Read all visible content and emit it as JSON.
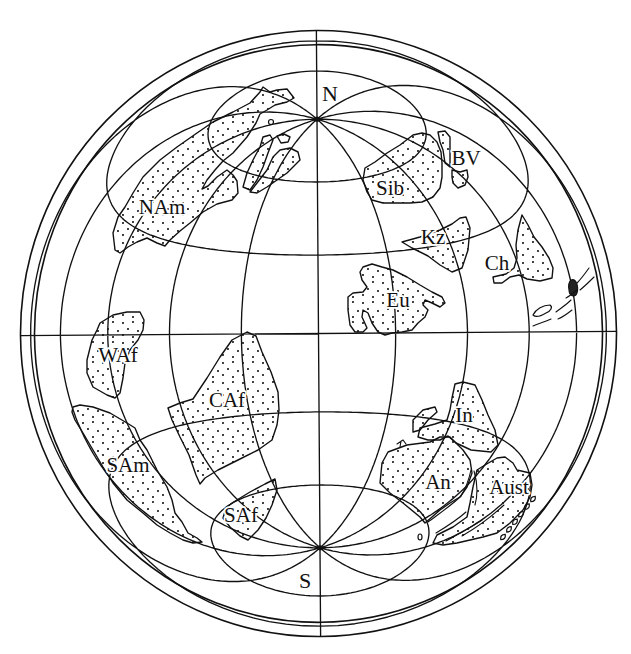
{
  "colors": {
    "ink": "#111111",
    "paper": "#ffffff"
  },
  "figure": {
    "pole_labels": {
      "north": "N",
      "south": "S"
    },
    "graticule": {
      "meridians_deg": [
        -150,
        -120,
        -90,
        -60,
        -30,
        0,
        30,
        60,
        90,
        120,
        150,
        180
      ],
      "parallels_deg": [
        -60,
        -30,
        0,
        30,
        60
      ]
    },
    "landmasses": {
      "nam": {
        "label": "NAm",
        "outline": "115,250 113,233 118,217 125,207 133,193 143,177 160,160 177,147 197,133 213,122 233,112 250,103 260,92 263,87 270,92 277,90 287,89 294,98 287,102 275,105 267,110 260,114 256,123 247,137 233,153 223,161 215,170 207,180 202,189 208,186 217,177 227,170 233,175 237,181 238,193 232,200 217,204 203,212 190,223 180,231 170,240 165,246 157,243 147,238 137,242 128,247 120,253",
        "islands": [
          "243,187 247,173 253,160 260,147 263,137 270,135 273,140 268,153 263,167 257,180 250,190",
          "250,192 257,183 267,170 273,157 280,150 290,148 298,152 300,160 293,167 287,173 277,180 267,187 257,193",
          "277,136 284,134 290,137 288,142 281,143"
        ]
      },
      "sib": {
        "label": "Sib",
        "outline": "365,168 375,162 387,153 400,145 413,135 422,133 430,135 437,142 441,152 442,163 442,177 440,188 433,197 422,202 410,203 383,203 372,200 367,192 363,180"
      },
      "bv": {
        "label": "BV",
        "outline": "438,132 445,131 450,137 450,153 450,167 445,163 443,150 440,142",
        "islands": [
          "452,170 460,172 467,170 468,177 465,185 458,188 453,183 452,177"
        ]
      },
      "kz": {
        "label": "Kz",
        "outline": "402,242 420,237 440,230 452,224 460,218 466,217 470,228 468,250 462,268 452,272 440,265 428,256 412,248"
      },
      "ch": {
        "label": "Ch",
        "outline": "522,215 528,225 534,237 542,247 549,258 553,268 552,278 540,281 527,279 519,275 510,277 502,283 494,283 493,277 506,274 514,268 517,258 516,245 518,230"
      },
      "eu": {
        "label": "Eu",
        "outline": "363,267 372,264 382,267 393,270 407,277 420,285 432,292 442,297 445,303 440,307 432,303 425,300 423,305 428,310 425,317 418,323 412,330 402,332 392,333 385,335 378,332 372,323 368,313 363,310 362,317 367,328 363,332 355,332 350,325 348,310 348,297 353,293 363,292 367,287 362,280 360,272"
      },
      "waf": {
        "label": "WAf",
        "outline": "100,323 113,315 127,312 140,312 144,320 143,330 138,340 130,350 125,363 123,378 120,393 115,398 107,395 93,387 87,373 87,360 92,340 97,330"
      },
      "caf": {
        "label": "CAf",
        "outline": "168,408 180,403 193,399 207,378 220,357 232,340 247,332 256,336 262,352 271,372 278,392 279,410 277,425 272,440 258,450 238,460 218,470 205,478 200,484 196,475 189,455 180,437 172,420"
      },
      "sam": {
        "label": "SAm",
        "outline": "73,407 80,405 93,407 110,413 127,423 135,428 140,440 147,450 157,470 167,487 172,500 175,513 182,522 188,533 197,538 202,542 193,543 183,540 170,533 157,525 143,513 127,500 113,483 103,467 93,450 83,433 75,420 72,412"
      },
      "saf": {
        "label": "SAf",
        "outline": "232,503 250,492 265,484 275,479 277,490 272,505 266,518 258,530 248,540 240,536 230,527 223,518 226,508"
      },
      "in": {
        "label": "In",
        "outline": "455,384 463,382 475,385 482,400 488,415 495,430 498,445 491,452 471,450 456,443 448,436 440,440 428,440 418,437 420,428 435,424 447,420 450,410 452,398",
        "islands": [
          "413,420 423,410 435,407 437,412 428,420 420,430 413,432"
        ]
      },
      "an": {
        "label": "An",
        "outline": "382,463 388,452 407,445 430,442 440,437 450,437 463,450 470,460 472,473 467,487 460,497 450,503 440,510 432,517 425,523 420,517 403,503 390,493 380,483"
      },
      "aust": {
        "label": "Aust",
        "outline": "477,470 485,465 497,458 505,457 513,463 517,470 530,473 532,485 530,497 523,510 510,523 497,533 483,537 470,540 457,543 443,545 433,543 437,535 453,527 467,517 470,503 473,487"
      }
    },
    "minor_features": {
      "island_arc_blob": "M571,280 C576,278 579,286 577,293 C575,298 569,296 569,290 C568,285 569,282 571,280 Z",
      "island_arc_lines": "M577,283 C581,279 584,275 589,268 M580,290 C585,286 589,282 594,277 M566,298 C570,296 573,293 577,290 M556,312 C561,308 566,305 571,300 M558,319 C563,317 567,314 572,310 M533,326 C540,323 545,322 551,319",
      "island_arc_islet": "M533,315 C536,309 543,305 550,305 C553,307 551,311 546,313 C541,316 536,318 533,315 Z",
      "aust_island_chain": "M500.8,539.7 Q506.1,539.5 505.2,534.3 Q499.9,534.5 500.8,539.7 Z M506.8,532.1 Q512.1,531.9 511.2,526.7 Q505.9,526.9 506.8,532.1 Z M512.8,524.5 Q518.1,524.3 517.2,519.1 Q511.9,519.3 512.8,524.5 Z M518.8,516.9 Q524.1,516.7 523.2,511.5 Q517.9,511.7 518.8,516.9 Z M524.8,509.3 Q530.1,509.1 529.2,503.9 Q523.9,504.1 524.8,509.3 Z M530.8,501.7 Q536.1,501.5 535.2,496.3 Q529.9,496.5 530.8,501.7 Z",
      "an_aust_coastlines": "M428,522 C440,513 452,505 461,496 C466,488 469,479 471,470 M436,533 C446,527 456,521 466,512 M446,541 C458,534 470,528 482,520 M462,536 C476,528 490,518 504,505 M474,471 C477,481 478,494 475,505",
      "nam_lake": "M268.5,122 a2.5,2.5 0 1,0 5,0 a2.5,2.5 0 1,0 -5,0 Z",
      "an_islet": "M418,537 a2,3 0 1,0 4,0 a2,3 0 1,0 -4,0 Z",
      "in_bird_mark": "M397,444 L403,440 L406,444 M401,441 L400,447"
    }
  }
}
